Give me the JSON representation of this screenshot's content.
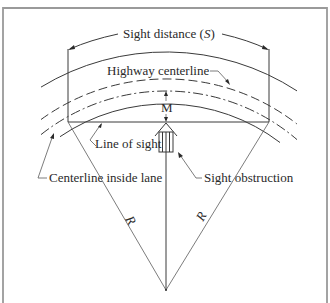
{
  "figure": {
    "labels": {
      "sight_distance": "Sight distance (",
      "sight_distance_symbol": "S",
      "sight_distance_close": ")",
      "highway_centerline": "Highway centerline",
      "middle_ordinate": "M",
      "line_of_sight": "Line of sight",
      "centerline_inside_lane": "Centerline inside lane",
      "sight_obstruction": "Sight obstruction",
      "radius_left": "R",
      "radius_right": "R"
    },
    "colors": {
      "line": "#3a3a3a",
      "frame": "#9a9a9a",
      "text": "#2a2a2a"
    }
  }
}
